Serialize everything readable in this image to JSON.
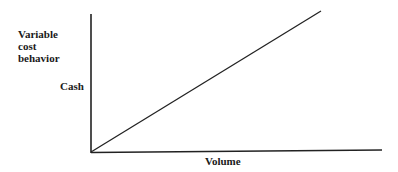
{
  "diagram": {
    "title_lines": [
      "Variable",
      "cost",
      "behavior"
    ],
    "y_axis_label": "Cash",
    "x_axis_label": "Volume",
    "line": "straight line rising from origin (variable cost increases proportionally with volume)"
  }
}
